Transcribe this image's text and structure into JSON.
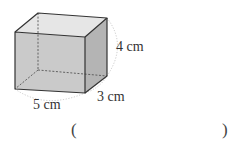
{
  "figure": {
    "type": "rectangular-prism",
    "dimensions": {
      "length": "5 cm",
      "width": "3 cm",
      "height": "4 cm"
    },
    "colors": {
      "front": "#c9c9c9",
      "top": "#e6e6e6",
      "side": "#b3b3b3",
      "edge": "#333333",
      "hidden_edge": "#555555",
      "arc": "#aaaaaa"
    }
  },
  "answer": {
    "open": "(",
    "close": ")",
    "value": ""
  }
}
